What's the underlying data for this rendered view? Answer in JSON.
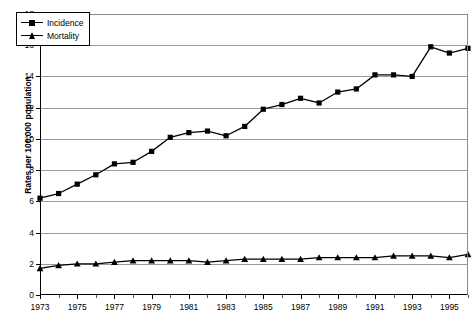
{
  "chart_data": {
    "type": "line",
    "title": "",
    "xlabel": "",
    "ylabel": "Rates per 100,000 population",
    "ylim": [
      0,
      18
    ],
    "ytick_labels": [
      "0",
      "2",
      "4",
      "6",
      "8",
      "10",
      "12",
      "14",
      "16",
      "18"
    ],
    "ytick_values": [
      0,
      2,
      4,
      6,
      8,
      10,
      12,
      14,
      16,
      18
    ],
    "xlim": [
      1973,
      1996
    ],
    "x": [
      1973,
      1974,
      1975,
      1976,
      1977,
      1978,
      1979,
      1980,
      1981,
      1982,
      1983,
      1984,
      1985,
      1986,
      1987,
      1988,
      1989,
      1990,
      1991,
      1992,
      1993,
      1994,
      1995,
      1996
    ],
    "xtick_labels": [
      "1973",
      "1975",
      "1977",
      "1979",
      "1981",
      "1983",
      "1985",
      "1987",
      "1989",
      "1991",
      "1993",
      "1995"
    ],
    "xtick_values": [
      1973,
      1975,
      1977,
      1979,
      1981,
      1983,
      1985,
      1987,
      1989,
      1991,
      1993,
      1995
    ],
    "xtick_minor_values": [
      1974,
      1976,
      1978,
      1980,
      1982,
      1984,
      1986,
      1988,
      1990,
      1992,
      1994,
      1996
    ],
    "grid": "horizontal",
    "legend_position": "top-left",
    "series": [
      {
        "name": "Incidence",
        "marker": "square",
        "color": "#000000",
        "values": [
          6.2,
          6.5,
          7.1,
          7.7,
          8.4,
          8.5,
          9.2,
          10.1,
          10.4,
          10.5,
          10.2,
          10.8,
          11.9,
          12.2,
          12.6,
          12.3,
          13.0,
          13.2,
          14.1,
          14.1,
          14.0,
          15.9,
          15.5,
          15.8
        ]
      },
      {
        "name": "Mortality",
        "marker": "triangle",
        "color": "#000000",
        "values": [
          1.7,
          1.9,
          2.0,
          2.0,
          2.1,
          2.2,
          2.2,
          2.2,
          2.2,
          2.1,
          2.2,
          2.3,
          2.3,
          2.3,
          2.3,
          2.4,
          2.4,
          2.4,
          2.4,
          2.5,
          2.5,
          2.5,
          2.4,
          2.6
        ]
      }
    ]
  },
  "legend": {
    "items": [
      {
        "label": "Incidence"
      },
      {
        "label": "Mortality"
      }
    ]
  }
}
